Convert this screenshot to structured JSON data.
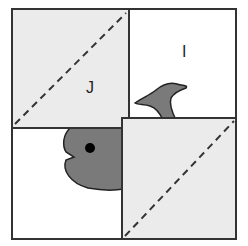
{
  "figure": {
    "labels": {
      "square_j": "J",
      "square_i": "I"
    },
    "colors": {
      "light_fill": "#ebebeb",
      "white_fill": "#ffffff",
      "whale_fill": "#7a7a7a",
      "stroke": "#333333",
      "eye": "#000000"
    }
  }
}
